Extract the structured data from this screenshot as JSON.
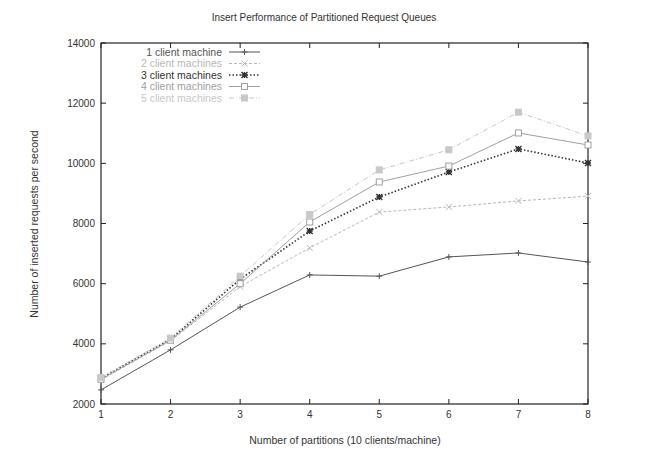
{
  "chart_data": {
    "type": "line",
    "title": "Insert Performance of Partitioned Request Queues",
    "xlabel": "Number of partitions (10 clients/machine)",
    "ylabel": "Number of inserted requests per second",
    "x": [
      1,
      2,
      3,
      4,
      5,
      6,
      7,
      8
    ],
    "xlim": [
      1,
      8
    ],
    "ylim": [
      2000,
      14000
    ],
    "xticks": [
      "1",
      "2",
      "3",
      "4",
      "5",
      "6",
      "7",
      "8"
    ],
    "yticks": [
      "2000",
      "4000",
      "6000",
      "8000",
      "10000",
      "12000",
      "14000"
    ],
    "grid": false,
    "legend_position": "upper left",
    "series": [
      {
        "name": "1 client machine",
        "marker": "plus",
        "line": "solid",
        "color": "#555555",
        "values": [
          2470,
          3800,
          5220,
          6290,
          6250,
          6890,
          7020,
          6720
        ]
      },
      {
        "name": "2 client machines",
        "marker": "x",
        "line": "dashed",
        "color": "#b8b8b8",
        "values": [
          2800,
          4100,
          5900,
          7190,
          8380,
          8550,
          8750,
          8910
        ]
      },
      {
        "name": "3 client machines",
        "marker": "star",
        "line": "dotted",
        "color": "#333333",
        "values": [
          2860,
          4150,
          6150,
          7750,
          8880,
          9710,
          10480,
          10010
        ]
      },
      {
        "name": "4 client machines",
        "marker": "square",
        "line": "solid",
        "color": "#a0a0a0",
        "values": [
          2820,
          4120,
          6000,
          8050,
          9380,
          9910,
          11010,
          10610
        ]
      },
      {
        "name": "5 client machines",
        "marker": "filled-square",
        "line": "dashdot",
        "color": "#c8c8c8",
        "values": [
          2880,
          4190,
          6250,
          8300,
          9780,
          10450,
          11700,
          10910
        ]
      }
    ]
  }
}
